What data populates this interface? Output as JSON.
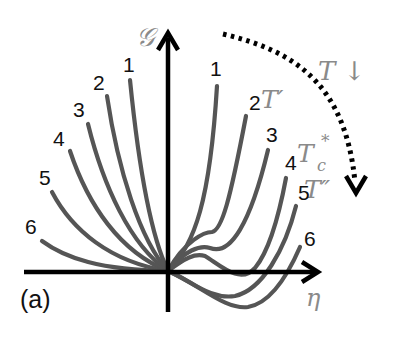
{
  "figure": {
    "panel_label": "(a)",
    "y_axis_label": "𝒢",
    "x_axis_label": "η",
    "trend_label": "T ↓",
    "temperature_labels": {
      "t_prime": "T′",
      "t_c_star": "T",
      "t_c_sub": "c",
      "t_c_sup": "*",
      "t_double_prime": "T″"
    },
    "left_curve_labels": [
      "1",
      "2",
      "3",
      "4",
      "5",
      "6"
    ],
    "right_curve_labels": [
      "1",
      "2",
      "3",
      "4",
      "5",
      "6"
    ],
    "colors": {
      "curves": "#555555",
      "axes": "#000000",
      "math_labels": "#8a8a8a",
      "arrow_dotted": "#000000"
    }
  }
}
